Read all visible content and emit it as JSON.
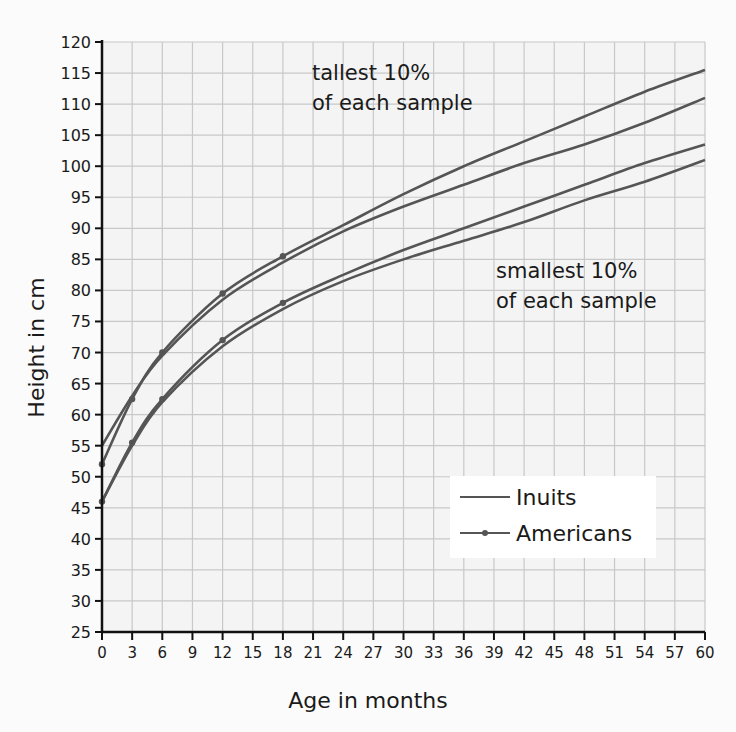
{
  "chart_data": {
    "type": "line",
    "title": "",
    "xlabel": "Age in months",
    "ylabel": "Height in cm",
    "xlim": [
      0,
      60
    ],
    "ylim": [
      25,
      120
    ],
    "x_ticks": [
      0,
      3,
      6,
      9,
      12,
      15,
      18,
      21,
      24,
      27,
      30,
      33,
      36,
      39,
      42,
      45,
      48,
      51,
      54,
      57,
      60
    ],
    "y_ticks": [
      25,
      30,
      35,
      40,
      45,
      50,
      55,
      60,
      65,
      70,
      75,
      80,
      85,
      90,
      95,
      100,
      105,
      110,
      115,
      120
    ],
    "grid": true,
    "legend_position": "lower right (inside plot)",
    "legend": [
      {
        "name": "Inuits",
        "marker": "none"
      },
      {
        "name": "Americans",
        "marker": "dot"
      }
    ],
    "series": [
      {
        "name": "Americans (tallest 10%)",
        "group": "Americans",
        "marker": "dot",
        "x": [
          0,
          3,
          6,
          12,
          18,
          24,
          30,
          36,
          42,
          48,
          54,
          60
        ],
        "y": [
          52,
          62.5,
          70,
          79.5,
          85.5,
          90.5,
          95.5,
          100,
          104,
          108,
          112,
          115.5
        ],
        "marked_x": [
          0,
          3,
          6,
          12,
          18
        ]
      },
      {
        "name": "Inuits (tallest 10%)",
        "group": "Inuits",
        "marker": "none",
        "x": [
          0,
          3,
          6,
          12,
          18,
          24,
          30,
          36,
          42,
          48,
          54,
          60
        ],
        "y": [
          55,
          63,
          69.5,
          78.5,
          84.5,
          89.5,
          93.5,
          97,
          100.5,
          103.5,
          107,
          111
        ]
      },
      {
        "name": "Americans (smallest 10%)",
        "group": "Americans",
        "marker": "dot",
        "x": [
          0,
          3,
          6,
          12,
          18,
          24,
          30,
          36,
          42,
          48,
          54,
          60
        ],
        "y": [
          46,
          55.5,
          62.5,
          72,
          78,
          82.5,
          86.5,
          90,
          93.5,
          97,
          100.5,
          103.5
        ],
        "marked_x": [
          0,
          3,
          6,
          12,
          18
        ]
      },
      {
        "name": "Inuits (smallest 10%)",
        "group": "Inuits",
        "marker": "none",
        "x": [
          0,
          3,
          6,
          12,
          18,
          24,
          30,
          36,
          42,
          48,
          54,
          60
        ],
        "y": [
          46,
          55,
          62,
          71,
          77,
          81.5,
          85,
          88,
          91,
          94.5,
          97.5,
          101
        ]
      }
    ],
    "annotations": [
      {
        "text": "tallest 10%\nof each sample",
        "near": "upper curves"
      },
      {
        "text": "smallest 10%\nof each sample",
        "near": "lower curves"
      }
    ]
  },
  "labels": {
    "xlabel": "Age in months",
    "ylabel": "Height in cm",
    "annot_tall_1": "tallest 10%",
    "annot_tall_2": "of each sample",
    "annot_small_1": "smallest 10%",
    "annot_small_2": "of each sample",
    "legend_inuits": "Inuits",
    "legend_americans": "Americans"
  },
  "colors": {
    "curve": "#555555",
    "grid": "#c8c8c8",
    "axis": "#111111",
    "plot_bg": "#f4f4f4"
  }
}
